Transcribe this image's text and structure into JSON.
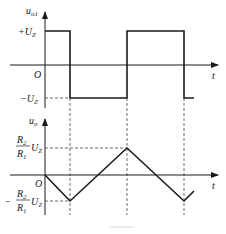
{
  "top_plot": {
    "y_label": "u",
    "y_label_sub": "o1",
    "high_label_sign": "+",
    "high_label": "U",
    "high_label_sub": "Z",
    "low_label_sign": "−",
    "low_label": "U",
    "low_label_sub": "Z",
    "origin_label": "O",
    "x_label": "t"
  },
  "bottom_plot": {
    "y_label": "u",
    "y_label_sub": "o",
    "peak_num": "R",
    "peak_num_sub": "2",
    "peak_den": "R",
    "peak_den_sub": "1",
    "peak_u": "U",
    "peak_u_sub": "Z",
    "trough_sign": "−",
    "trough_num": "R",
    "trough_num_sub": "2",
    "trough_den": "R",
    "trough_den_sub": "1",
    "trough_u": "U",
    "trough_u_sub": "Z",
    "origin_label": "O",
    "x_label": "t"
  },
  "colors": {
    "line": "#1a1a1a",
    "dashed": "#444444"
  }
}
